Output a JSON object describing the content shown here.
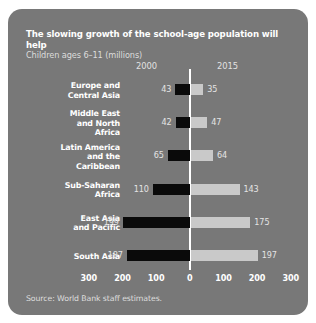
{
  "figure": {
    "title": "The slowing growth of the school-age population will help",
    "subtitle": "Children ages 6–11 (millions)",
    "source": "Source: World Bank staff estimates.",
    "panel_color": "#787878",
    "series_2000_color": "#0a0a0a",
    "series_2015_color": "#c9c9c9"
  },
  "header": {
    "left_year": "2000",
    "right_year": "2015"
  },
  "chart_data": {
    "type": "bar",
    "orientation": "horizontal-diverging",
    "title": "The slowing growth of the school-age population will help",
    "subtitle": "Children ages 6–11 (millions)",
    "xlabel": "",
    "ylabel": "",
    "xlim": [
      -300,
      300
    ],
    "grid": false,
    "legend_position": "top",
    "categories": [
      "Europe and Central Asia",
      "Middle East and North Africa",
      "Latin America and the Caribbean",
      "Sub-Saharan Africa",
      "East Asia and Pacific",
      "South Asia"
    ],
    "category_lines": [
      [
        "Europe and",
        "Central Asia"
      ],
      [
        "Middle East",
        "and North",
        "Africa"
      ],
      [
        "Latin America",
        "and the",
        "Caribbean"
      ],
      [
        "Sub-Saharan",
        "Africa"
      ],
      [
        "East Asia",
        "and Pacific"
      ],
      [
        "South Asia"
      ]
    ],
    "series": [
      {
        "name": "2000",
        "direction": "left",
        "color": "#0a0a0a",
        "values": [
          43,
          42,
          65,
          110,
          199,
          187
        ]
      },
      {
        "name": "2015",
        "direction": "right",
        "color": "#c9c9c9",
        "values": [
          35,
          47,
          64,
          143,
          175,
          197
        ]
      }
    ],
    "xticks": [
      {
        "label": "300",
        "value": -300
      },
      {
        "label": "200",
        "value": -200
      },
      {
        "label": "100",
        "value": -100
      },
      {
        "label": "0",
        "value": 0
      },
      {
        "label": "100",
        "value": 100
      },
      {
        "label": "200",
        "value": 200
      },
      {
        "label": "300",
        "value": 300
      }
    ]
  }
}
